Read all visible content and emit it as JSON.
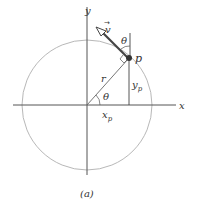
{
  "diagram": {
    "caption": "(a)",
    "axes": {
      "x_label": "x",
      "y_label": "y"
    },
    "labels": {
      "velocity": "v",
      "velocity_arrow_glyph": "→",
      "point": "p",
      "radius": "r",
      "angle_top": "θ",
      "angle_origin": "θ",
      "y_component": "y",
      "y_component_sub": "p",
      "x_component": "x",
      "x_component_sub": "p"
    },
    "colors": {
      "circle": "#b8b8b8",
      "axes": "#555555",
      "arrow": "#444444",
      "point": "#333333"
    }
  }
}
